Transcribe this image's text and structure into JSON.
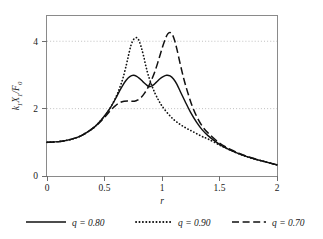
{
  "chart_data": {
    "type": "line",
    "title": "",
    "xlabel": "r",
    "ylabel": "k₁X₁/F₀",
    "xlim": [
      0,
      2
    ],
    "ylim": [
      0,
      4.75
    ],
    "xticks": [
      "0",
      "0.5",
      "1",
      "1.5",
      "2"
    ],
    "xtick_values": [
      0,
      0.5,
      1,
      1.5,
      2
    ],
    "yticks": [
      "0",
      "2",
      "4"
    ],
    "ytick_values": [
      0,
      2,
      4
    ],
    "grid": "horizontal dotted gridlines at y = 2 and y = 4",
    "legend_position": "below plot, horizontal",
    "series": [
      {
        "name": "q = 0.80",
        "style": "solid",
        "x": [
          0,
          0.1,
          0.2,
          0.3,
          0.4,
          0.45,
          0.5,
          0.55,
          0.6,
          0.63,
          0.66,
          0.69,
          0.72,
          0.75,
          0.78,
          0.81,
          0.84,
          0.87,
          0.89,
          0.92,
          0.95,
          0.98,
          1.01,
          1.04,
          1.07,
          1.1,
          1.13,
          1.16,
          1.2,
          1.25,
          1.3,
          1.35,
          1.4,
          1.5,
          1.6,
          1.7,
          1.8,
          1.9,
          2.0
        ],
        "y": [
          1.0,
          1.02,
          1.08,
          1.2,
          1.42,
          1.58,
          1.78,
          2.02,
          2.32,
          2.52,
          2.7,
          2.85,
          2.95,
          2.99,
          2.96,
          2.88,
          2.78,
          2.69,
          2.65,
          2.69,
          2.78,
          2.88,
          2.95,
          2.99,
          2.97,
          2.88,
          2.72,
          2.5,
          2.22,
          1.88,
          1.6,
          1.37,
          1.2,
          0.94,
          0.76,
          0.62,
          0.51,
          0.42,
          0.33
        ]
      },
      {
        "name": "q = 0.90",
        "style": "dotted",
        "x": [
          0,
          0.1,
          0.2,
          0.3,
          0.4,
          0.45,
          0.5,
          0.55,
          0.6,
          0.63,
          0.66,
          0.69,
          0.71,
          0.73,
          0.75,
          0.77,
          0.785,
          0.8,
          0.82,
          0.84,
          0.86,
          0.88,
          0.91,
          0.94,
          0.97,
          1.0,
          1.05,
          1.1,
          1.15,
          1.2,
          1.25,
          1.3,
          1.35,
          1.4,
          1.5,
          1.6,
          1.7,
          1.8,
          1.9,
          2.0
        ],
        "y": [
          1.0,
          1.02,
          1.08,
          1.2,
          1.42,
          1.58,
          1.78,
          2.02,
          2.35,
          2.6,
          2.9,
          3.3,
          3.6,
          3.88,
          4.04,
          4.1,
          4.1,
          4.02,
          3.82,
          3.56,
          3.26,
          3.0,
          2.7,
          2.45,
          2.25,
          2.08,
          1.86,
          1.68,
          1.55,
          1.44,
          1.35,
          1.26,
          1.17,
          1.1,
          0.92,
          0.76,
          0.62,
          0.51,
          0.42,
          0.33
        ]
      },
      {
        "name": "q = 0.70",
        "style": "dashed",
        "x": [
          0,
          0.1,
          0.2,
          0.3,
          0.4,
          0.45,
          0.5,
          0.55,
          0.58,
          0.61,
          0.64,
          0.67,
          0.7,
          0.73,
          0.76,
          0.79,
          0.82,
          0.85,
          0.88,
          0.91,
          0.94,
          0.97,
          1.0,
          1.03,
          1.05,
          1.07,
          1.09,
          1.11,
          1.13,
          1.16,
          1.19,
          1.22,
          1.26,
          1.3,
          1.35,
          1.4,
          1.5,
          1.6,
          1.7,
          1.8,
          1.9,
          2.0
        ],
        "y": [
          1.0,
          1.02,
          1.08,
          1.2,
          1.42,
          1.56,
          1.74,
          1.94,
          2.04,
          2.13,
          2.19,
          2.22,
          2.23,
          2.22,
          2.22,
          2.26,
          2.34,
          2.47,
          2.64,
          2.86,
          3.12,
          3.44,
          3.78,
          4.08,
          4.22,
          4.26,
          4.2,
          4.02,
          3.76,
          3.3,
          2.88,
          2.52,
          2.1,
          1.78,
          1.48,
          1.28,
          0.98,
          0.78,
          0.63,
          0.52,
          0.42,
          0.33
        ]
      }
    ]
  },
  "axes": {
    "ylabel": "k₁X₁/F₀",
    "ylabel_parts": {
      "k": "k",
      "k_sub": "1",
      "X": "X",
      "X_sub": "1",
      "slash": "/",
      "F": "F",
      "F_sub": "0"
    },
    "xlabel": "r",
    "xtick_0": "0",
    "xtick_1": "0.5",
    "xtick_2": "1",
    "xtick_3": "1.5",
    "xtick_4": "2",
    "ytick_0": "0",
    "ytick_1": "2",
    "ytick_2": "4"
  },
  "legend": {
    "items": [
      {
        "label": "q = 0.80",
        "style": "solid"
      },
      {
        "label": "q = 0.90",
        "style": "dotted"
      },
      {
        "label": "q = 0.70",
        "style": "dashed"
      }
    ]
  },
  "colors": {
    "curve": "#111111",
    "grid": "#b9b9b9",
    "frame": "#8a8a8a",
    "background": "#ffffff"
  }
}
